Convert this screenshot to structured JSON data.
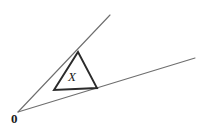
{
  "figure": {
    "kind": "geometry-diagram",
    "background_color": "#ffffff",
    "width": 209,
    "height": 132,
    "labels": {
      "vertex": "0",
      "interior_region": "X"
    },
    "styles": {
      "ray_color": "#6e6e6e",
      "ray_width": 1.1,
      "triangle_color": "#2b2b2b",
      "triangle_width": 1.9,
      "label_color": "#1a1a1a"
    },
    "geometry": {
      "vertex_point": {
        "x": 18,
        "y": 112
      },
      "upper_ray": {
        "x1": 18,
        "y1": 112,
        "x2": 110,
        "y2": 15
      },
      "lower_ray": {
        "x1": 18,
        "y1": 112,
        "x2": 195,
        "y2": 58
      },
      "triangle_points": "78,52 97,88 54,90",
      "triangle_vertices": [
        {
          "name": "apex",
          "x": 78,
          "y": 52
        },
        {
          "name": "base-right",
          "x": 97,
          "y": 88
        },
        {
          "name": "base-left",
          "x": 54,
          "y": 90
        }
      ]
    }
  }
}
